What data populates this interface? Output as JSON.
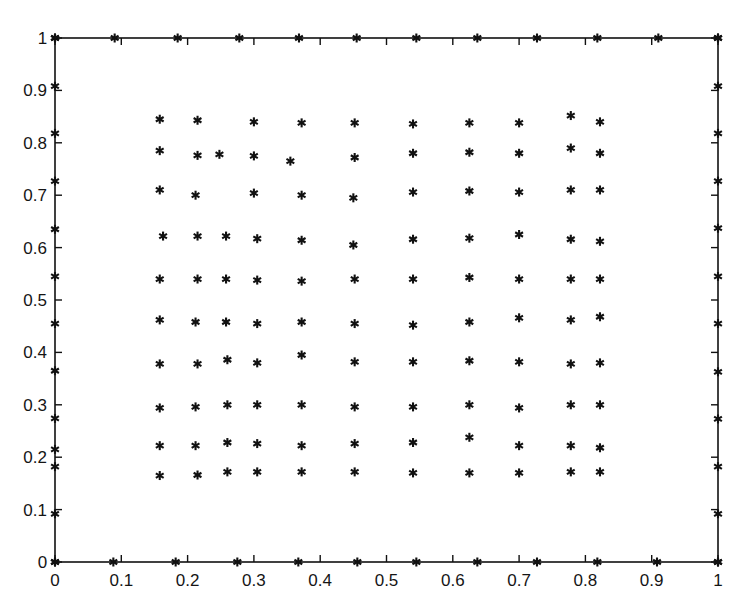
{
  "figure": {
    "title_remnant": "",
    "marker_symbol": "asterisk",
    "marker_color": "#111111",
    "axis_color": "#111111",
    "background_color": "#ffffff"
  },
  "chart_data": {
    "type": "scatter",
    "title": "",
    "subtitle": "",
    "xlabel": "",
    "ylabel": "",
    "xlim": [
      0,
      1
    ],
    "ylim": [
      0,
      1
    ],
    "grid": false,
    "legend": null,
    "marker": "asterisk",
    "marker_size": 9,
    "color": "#111111",
    "xticks": [
      0,
      0.1,
      0.2,
      0.3,
      0.4,
      0.5,
      0.6,
      0.7,
      0.8,
      0.9,
      1
    ],
    "xtick_labels": [
      "0",
      "0.1",
      "0.2",
      "0.3",
      "0.4",
      "0.5",
      "0.6",
      "0.7",
      "0.8",
      "0.9",
      "1"
    ],
    "yticks": [
      0,
      0.1,
      0.2,
      0.3,
      0.4,
      0.5,
      0.6,
      0.7,
      0.8,
      0.9,
      1
    ],
    "ytick_labels": [
      "0",
      "0.1",
      "0.2",
      "0.3",
      "0.4",
      "0.5",
      "0.6",
      "0.7",
      "0.8",
      "0.9",
      "1"
    ],
    "series": [
      {
        "name": "boundary-nodes-bottom",
        "points": [
          [
            0.0,
            0.0
          ],
          [
            0.088,
            0.0
          ],
          [
            0.182,
            0.0
          ],
          [
            0.275,
            0.0
          ],
          [
            0.367,
            0.0
          ],
          [
            0.456,
            0.0
          ],
          [
            0.545,
            0.0
          ],
          [
            0.637,
            0.0
          ],
          [
            0.727,
            0.0
          ],
          [
            0.818,
            0.0
          ],
          [
            0.908,
            0.0
          ],
          [
            1.0,
            0.0
          ]
        ]
      },
      {
        "name": "boundary-nodes-top",
        "points": [
          [
            0.0,
            1.0
          ],
          [
            0.09,
            1.0
          ],
          [
            0.185,
            1.0
          ],
          [
            0.278,
            1.0
          ],
          [
            0.368,
            1.0
          ],
          [
            0.455,
            1.0
          ],
          [
            0.545,
            1.0
          ],
          [
            0.637,
            1.0
          ],
          [
            0.727,
            1.0
          ],
          [
            0.818,
            1.0
          ],
          [
            0.91,
            1.0
          ],
          [
            1.0,
            1.0
          ]
        ]
      },
      {
        "name": "boundary-nodes-left",
        "points": [
          [
            0.0,
            0.0
          ],
          [
            0.0,
            0.092
          ],
          [
            0.0,
            0.182
          ],
          [
            0.0,
            0.215
          ],
          [
            0.0,
            0.274
          ],
          [
            0.0,
            0.365
          ],
          [
            0.0,
            0.455
          ],
          [
            0.0,
            0.545
          ],
          [
            0.0,
            0.635
          ],
          [
            0.0,
            0.727
          ],
          [
            0.0,
            0.818
          ],
          [
            0.0,
            0.908
          ],
          [
            0.0,
            1.0
          ]
        ]
      },
      {
        "name": "boundary-nodes-right",
        "points": [
          [
            1.0,
            0.0
          ],
          [
            1.0,
            0.092
          ],
          [
            1.0,
            0.182
          ],
          [
            1.0,
            0.273
          ],
          [
            1.0,
            0.363
          ],
          [
            1.0,
            0.455
          ],
          [
            1.0,
            0.545
          ],
          [
            1.0,
            0.637
          ],
          [
            1.0,
            0.727
          ],
          [
            1.0,
            0.818
          ],
          [
            1.0,
            0.908
          ],
          [
            1.0,
            1.0
          ]
        ]
      },
      {
        "name": "interior-nodes",
        "points": [
          [
            0.158,
            0.845
          ],
          [
            0.215,
            0.843
          ],
          [
            0.3,
            0.84
          ],
          [
            0.372,
            0.838
          ],
          [
            0.452,
            0.838
          ],
          [
            0.54,
            0.836
          ],
          [
            0.625,
            0.838
          ],
          [
            0.7,
            0.838
          ],
          [
            0.778,
            0.852
          ],
          [
            0.822,
            0.84
          ],
          [
            0.158,
            0.785
          ],
          [
            0.215,
            0.776
          ],
          [
            0.248,
            0.778
          ],
          [
            0.3,
            0.775
          ],
          [
            0.355,
            0.765
          ],
          [
            0.452,
            0.772
          ],
          [
            0.54,
            0.78
          ],
          [
            0.625,
            0.782
          ],
          [
            0.7,
            0.78
          ],
          [
            0.778,
            0.79
          ],
          [
            0.822,
            0.78
          ],
          [
            0.158,
            0.71
          ],
          [
            0.212,
            0.7
          ],
          [
            0.3,
            0.704
          ],
          [
            0.372,
            0.7
          ],
          [
            0.45,
            0.695
          ],
          [
            0.54,
            0.706
          ],
          [
            0.625,
            0.708
          ],
          [
            0.7,
            0.706
          ],
          [
            0.778,
            0.71
          ],
          [
            0.822,
            0.71
          ],
          [
            0.163,
            0.622
          ],
          [
            0.215,
            0.622
          ],
          [
            0.258,
            0.622
          ],
          [
            0.305,
            0.617
          ],
          [
            0.372,
            0.614
          ],
          [
            0.45,
            0.605
          ],
          [
            0.54,
            0.616
          ],
          [
            0.625,
            0.618
          ],
          [
            0.7,
            0.625
          ],
          [
            0.778,
            0.616
          ],
          [
            0.822,
            0.612
          ],
          [
            0.158,
            0.54
          ],
          [
            0.215,
            0.54
          ],
          [
            0.258,
            0.54
          ],
          [
            0.305,
            0.538
          ],
          [
            0.372,
            0.536
          ],
          [
            0.452,
            0.54
          ],
          [
            0.54,
            0.54
          ],
          [
            0.625,
            0.543
          ],
          [
            0.7,
            0.54
          ],
          [
            0.778,
            0.54
          ],
          [
            0.822,
            0.54
          ],
          [
            0.158,
            0.462
          ],
          [
            0.212,
            0.458
          ],
          [
            0.258,
            0.458
          ],
          [
            0.305,
            0.455
          ],
          [
            0.372,
            0.458
          ],
          [
            0.452,
            0.455
          ],
          [
            0.54,
            0.452
          ],
          [
            0.625,
            0.458
          ],
          [
            0.7,
            0.466
          ],
          [
            0.778,
            0.462
          ],
          [
            0.822,
            0.468
          ],
          [
            0.158,
            0.378
          ],
          [
            0.215,
            0.378
          ],
          [
            0.26,
            0.386
          ],
          [
            0.305,
            0.38
          ],
          [
            0.372,
            0.395
          ],
          [
            0.452,
            0.382
          ],
          [
            0.54,
            0.382
          ],
          [
            0.625,
            0.384
          ],
          [
            0.7,
            0.382
          ],
          [
            0.778,
            0.378
          ],
          [
            0.822,
            0.38
          ],
          [
            0.158,
            0.294
          ],
          [
            0.212,
            0.296
          ],
          [
            0.26,
            0.3
          ],
          [
            0.305,
            0.3
          ],
          [
            0.372,
            0.3
          ],
          [
            0.452,
            0.296
          ],
          [
            0.54,
            0.296
          ],
          [
            0.625,
            0.3
          ],
          [
            0.7,
            0.294
          ],
          [
            0.778,
            0.3
          ],
          [
            0.822,
            0.3
          ],
          [
            0.158,
            0.222
          ],
          [
            0.212,
            0.222
          ],
          [
            0.26,
            0.228
          ],
          [
            0.305,
            0.226
          ],
          [
            0.372,
            0.222
          ],
          [
            0.452,
            0.226
          ],
          [
            0.54,
            0.228
          ],
          [
            0.625,
            0.238
          ],
          [
            0.7,
            0.222
          ],
          [
            0.778,
            0.222
          ],
          [
            0.822,
            0.218
          ],
          [
            0.158,
            0.165
          ],
          [
            0.215,
            0.166
          ],
          [
            0.26,
            0.172
          ],
          [
            0.305,
            0.172
          ],
          [
            0.372,
            0.172
          ],
          [
            0.452,
            0.172
          ],
          [
            0.54,
            0.17
          ],
          [
            0.625,
            0.17
          ],
          [
            0.7,
            0.17
          ],
          [
            0.778,
            0.172
          ],
          [
            0.822,
            0.172
          ]
        ]
      }
    ]
  },
  "geometry": {
    "plot_left_px": 55,
    "plot_right_px": 718,
    "plot_top_px": 38,
    "plot_bottom_px": 562,
    "tick_length_px": 7
  }
}
